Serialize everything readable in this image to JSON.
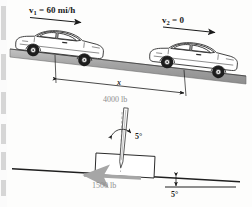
{
  "figure": {
    "colors": {
      "ink": "#1a1a1a",
      "road_fill": "#9b9b9b",
      "road_fill_light": "#b9b9b9",
      "grey_label": "#8e8e8e",
      "grey_arrow": "#a0a0a0",
      "paper": "#fdfdfc"
    }
  },
  "top_diagram": {
    "name": "cars-on-incline",
    "velocity_1": {
      "symbol": "v",
      "subscript": "1",
      "equals": "=",
      "value": "60 mi/h",
      "full": "v1 = 60 mi/h"
    },
    "velocity_2": {
      "symbol": "v",
      "subscript": "2",
      "equals": "=",
      "value": "0",
      "full": "v2 = 0"
    },
    "distance_label": "x",
    "car_left_name": "car-left",
    "car_right_name": "car-right",
    "arrow_1_name": "velocity-arrow-1",
    "arrow_2_name": "velocity-arrow-2"
  },
  "bottom_diagram": {
    "name": "block-on-incline",
    "force_normalish": {
      "value": "4000",
      "unit": "lb",
      "full": "4000 lb"
    },
    "force_along": {
      "value": "1500",
      "unit": "lb",
      "full": "1500 lb"
    },
    "angle_at_force": {
      "value": "5",
      "unit": "°",
      "full": "5°"
    },
    "angle_of_incline": {
      "value": "5",
      "unit": "°",
      "full": "5°"
    },
    "block_name": "block",
    "incline_name": "incline-line",
    "reference_line_name": "horizontal-reference-line"
  }
}
